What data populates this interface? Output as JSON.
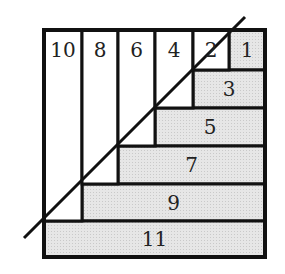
{
  "diagram": {
    "colors": {
      "outline": "#111111",
      "shaded": "#e4e4e4",
      "blank": "#ffffff",
      "text": "#222222"
    },
    "columns": [
      {
        "label": "10",
        "x": 44,
        "w": 38
      },
      {
        "label": "8",
        "x": 82,
        "w": 36
      },
      {
        "label": "6",
        "x": 118,
        "w": 37
      },
      {
        "label": "4",
        "x": 155,
        "w": 38
      },
      {
        "label": "2",
        "x": 193,
        "w": 36
      }
    ],
    "rows": [
      {
        "label": "1",
        "x": 229,
        "y": 30,
        "w": 36,
        "h": 40
      },
      {
        "label": "3",
        "x": 193,
        "y": 70,
        "w": 72,
        "h": 38
      },
      {
        "label": "5",
        "x": 155,
        "y": 108,
        "w": 110,
        "h": 38
      },
      {
        "label": "7",
        "x": 118,
        "y": 146,
        "w": 147,
        "h": 38
      },
      {
        "label": "9",
        "x": 82,
        "y": 184,
        "w": 183,
        "h": 37
      },
      {
        "label": "11",
        "x": 44,
        "y": 221,
        "w": 221,
        "h": 36
      }
    ],
    "diagonal": {
      "x1": 24,
      "y1": 238,
      "x2": 245,
      "y2": 17
    }
  }
}
